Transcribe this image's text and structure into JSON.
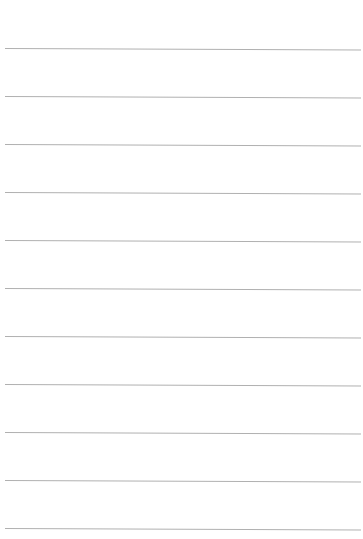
{
  "page": {
    "type": "lined-paper",
    "background_color": "#ffffff",
    "rule_color": "#b0b0b0",
    "rule_count": 11,
    "rules": [
      {
        "y_left": 48.5,
        "y_right": 50
      },
      {
        "y_left": 96.5,
        "y_right": 98
      },
      {
        "y_left": 144.5,
        "y_right": 146
      },
      {
        "y_left": 192.5,
        "y_right": 194
      },
      {
        "y_left": 240.5,
        "y_right": 242
      },
      {
        "y_left": 288.5,
        "y_right": 290
      },
      {
        "y_left": 336.5,
        "y_right": 338
      },
      {
        "y_left": 384.5,
        "y_right": 386
      },
      {
        "y_left": 432.5,
        "y_right": 434
      },
      {
        "y_left": 480.5,
        "y_right": 482
      },
      {
        "y_left": 528.5,
        "y_right": 530
      }
    ],
    "rule_x_start": 5,
    "rule_x_end": 361
  }
}
